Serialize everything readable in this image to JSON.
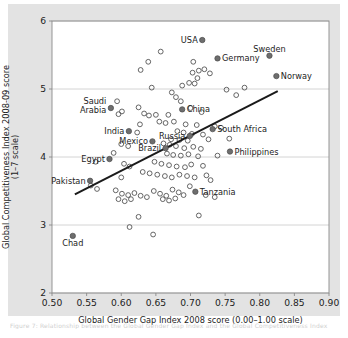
{
  "figure": {
    "caption": "Figure 7: Relationship between the Global Gender Gap Index and the Global Competitiveness Index",
    "background_color": "#e3e3e3",
    "panel_color": "#ffffff"
  },
  "chart_data": {
    "type": "scatter",
    "title": "",
    "xlabel": "Global Gender Gap Index 2008 score (0.00–1.00 scale)",
    "ylabel": "Global Competitiveness Index 2008-09 score (1–7 scale)",
    "xlim": [
      0.5,
      0.9
    ],
    "ylim": [
      2,
      6
    ],
    "xticks": [
      "0.50",
      "0.55",
      "0.60",
      "0.65",
      "0.70",
      "0.75",
      "0.80",
      "0.85",
      "0.90"
    ],
    "xtick_values": [
      0.5,
      0.55,
      0.6,
      0.65,
      0.7,
      0.75,
      0.8,
      0.85,
      0.9
    ],
    "yticks": [
      "6",
      "5",
      "4",
      "3",
      "2"
    ],
    "ytick_values": [
      6,
      5,
      4,
      3,
      2
    ],
    "grid": "horizontal",
    "legend": "none",
    "marker_styles": {
      "unlabeled": "open-circle",
      "labeled": "filled-circle"
    },
    "colors": {
      "marker_stroke": "#555555",
      "marker_fill": "#6e6e6e",
      "trendline": "#1a1a1a",
      "gridline": "#c9c9c9",
      "axis": "#8a8a8a"
    },
    "trendline": {
      "type": "linear-fit",
      "x_start": 0.533,
      "y_start": 3.45,
      "x_end": 0.826,
      "y_end": 4.97
    },
    "labeled_points": [
      {
        "name": "USA",
        "x": 0.717,
        "y": 5.72,
        "label_side": "left"
      },
      {
        "name": "Germany",
        "x": 0.739,
        "y": 5.45,
        "label_side": "right"
      },
      {
        "name": "Sweden",
        "x": 0.814,
        "y": 5.49,
        "label_side": "above"
      },
      {
        "name": "Norway",
        "x": 0.824,
        "y": 5.19,
        "label_side": "right"
      },
      {
        "name": "Saudi Arabia",
        "x": 0.585,
        "y": 4.72,
        "label_side": "left"
      },
      {
        "name": "China",
        "x": 0.688,
        "y": 4.7,
        "label_side": "right"
      },
      {
        "name": "India",
        "x": 0.611,
        "y": 4.38,
        "label_side": "left"
      },
      {
        "name": "Russia",
        "x": 0.699,
        "y": 4.31,
        "label_side": "left"
      },
      {
        "name": "South Africa",
        "x": 0.732,
        "y": 4.41,
        "label_side": "right"
      },
      {
        "name": "Mexico",
        "x": 0.645,
        "y": 4.23,
        "label_side": "left"
      },
      {
        "name": "Philippines",
        "x": 0.757,
        "y": 4.08,
        "label_side": "right"
      },
      {
        "name": "Brazil",
        "x": 0.664,
        "y": 4.13,
        "label_side": "left"
      },
      {
        "name": "Egypt",
        "x": 0.583,
        "y": 3.97,
        "label_side": "left"
      },
      {
        "name": "Pakistan",
        "x": 0.555,
        "y": 3.65,
        "label_side": "left"
      },
      {
        "name": "Tanzania",
        "x": 0.707,
        "y": 3.49,
        "label_side": "right"
      },
      {
        "name": "Chad",
        "x": 0.53,
        "y": 2.84,
        "label_side": "below"
      }
    ],
    "unlabeled_points": [
      [
        0.657,
        5.55
      ],
      [
        0.639,
        5.4
      ],
      [
        0.628,
        5.28
      ],
      [
        0.704,
        5.4
      ],
      [
        0.712,
        5.27
      ],
      [
        0.72,
        5.29
      ],
      [
        0.703,
        5.24
      ],
      [
        0.71,
        5.16
      ],
      [
        0.728,
        5.23
      ],
      [
        0.698,
        5.09
      ],
      [
        0.706,
        5.08
      ],
      [
        0.644,
        5.02
      ],
      [
        0.688,
        5.05
      ],
      [
        0.752,
        4.99
      ],
      [
        0.778,
        5.02
      ],
      [
        0.594,
        4.82
      ],
      [
        0.673,
        4.95
      ],
      [
        0.766,
        4.91
      ],
      [
        0.679,
        4.88
      ],
      [
        0.686,
        4.82
      ],
      [
        0.601,
        4.67
      ],
      [
        0.596,
        4.63
      ],
      [
        0.625,
        4.73
      ],
      [
        0.633,
        4.64
      ],
      [
        0.64,
        4.61
      ],
      [
        0.65,
        4.62
      ],
      [
        0.668,
        4.62
      ],
      [
        0.7,
        4.72
      ],
      [
        0.716,
        4.66
      ],
      [
        0.655,
        4.52
      ],
      [
        0.664,
        4.5
      ],
      [
        0.676,
        4.52
      ],
      [
        0.627,
        4.48
      ],
      [
        0.693,
        4.48
      ],
      [
        0.709,
        4.47
      ],
      [
        0.735,
        4.45
      ],
      [
        0.744,
        4.43
      ],
      [
        0.623,
        4.36
      ],
      [
        0.681,
        4.38
      ],
      [
        0.69,
        4.36
      ],
      [
        0.702,
        4.34
      ],
      [
        0.718,
        4.33
      ],
      [
        0.6,
        4.19
      ],
      [
        0.61,
        4.16
      ],
      [
        0.672,
        4.26
      ],
      [
        0.684,
        4.25
      ],
      [
        0.696,
        4.24
      ],
      [
        0.726,
        4.26
      ],
      [
        0.756,
        4.27
      ],
      [
        0.661,
        4.2
      ],
      [
        0.67,
        4.18
      ],
      [
        0.679,
        4.16
      ],
      [
        0.691,
        4.13
      ],
      [
        0.704,
        4.15
      ],
      [
        0.715,
        4.12
      ],
      [
        0.589,
        4.06
      ],
      [
        0.666,
        4.05
      ],
      [
        0.675,
        4.03
      ],
      [
        0.686,
        4.02
      ],
      [
        0.697,
        4.04
      ],
      [
        0.711,
        4.01
      ],
      [
        0.739,
        4.02
      ],
      [
        0.563,
        3.93
      ],
      [
        0.604,
        3.9
      ],
      [
        0.612,
        3.86
      ],
      [
        0.648,
        3.93
      ],
      [
        0.658,
        3.9
      ],
      [
        0.669,
        3.88
      ],
      [
        0.68,
        3.86
      ],
      [
        0.692,
        3.85
      ],
      [
        0.701,
        3.89
      ],
      [
        0.718,
        3.87
      ],
      [
        0.556,
        3.58
      ],
      [
        0.565,
        3.53
      ],
      [
        0.6,
        3.7
      ],
      [
        0.631,
        3.78
      ],
      [
        0.641,
        3.76
      ],
      [
        0.652,
        3.74
      ],
      [
        0.663,
        3.72
      ],
      [
        0.673,
        3.7
      ],
      [
        0.684,
        3.74
      ],
      [
        0.695,
        3.72
      ],
      [
        0.706,
        3.7
      ],
      [
        0.723,
        3.73
      ],
      [
        0.729,
        3.66
      ],
      [
        0.592,
        3.51
      ],
      [
        0.601,
        3.46
      ],
      [
        0.61,
        3.44
      ],
      [
        0.619,
        3.47
      ],
      [
        0.628,
        3.43
      ],
      [
        0.637,
        3.41
      ],
      [
        0.647,
        3.5
      ],
      [
        0.656,
        3.46
      ],
      [
        0.665,
        3.43
      ],
      [
        0.674,
        3.52
      ],
      [
        0.683,
        3.48
      ],
      [
        0.69,
        3.44
      ],
      [
        0.699,
        3.57
      ],
      [
        0.66,
        3.38
      ],
      [
        0.669,
        3.36
      ],
      [
        0.678,
        3.39
      ],
      [
        0.596,
        3.38
      ],
      [
        0.605,
        3.35
      ],
      [
        0.614,
        3.38
      ],
      [
        0.722,
        3.44
      ],
      [
        0.735,
        3.41
      ],
      [
        0.625,
        3.12
      ],
      [
        0.712,
        3.14
      ],
      [
        0.646,
        2.86
      ],
      [
        0.612,
        2.97
      ]
    ],
    "n_unlabeled": 110,
    "n_labeled": 16
  }
}
